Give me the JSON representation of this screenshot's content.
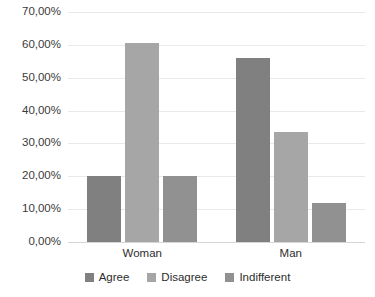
{
  "chart_data": {
    "type": "bar",
    "title": "",
    "subtitle": "",
    "xlabel": "",
    "ylabel": "",
    "categories": [
      "Woman",
      "Man"
    ],
    "series": [
      {
        "name": "Agree",
        "color": "#808080",
        "values": [
          20.0,
          56.0
        ]
      },
      {
        "name": "Disagree",
        "color": "#a6a6a6",
        "values": [
          60.5,
          33.5
        ]
      },
      {
        "name": "Indifferent",
        "color": "#919191",
        "values": [
          20.0,
          12.0
        ]
      }
    ],
    "ylim": [
      0,
      70
    ],
    "ytick_values": [
      0,
      10,
      20,
      30,
      40,
      50,
      60,
      70
    ],
    "ytick_labels": [
      "0,00%",
      "10,00%",
      "20,00%",
      "30,00%",
      "40,00%",
      "50,00%",
      "60,00%",
      "70,00%"
    ],
    "value_format": "percent-comma",
    "grid": {
      "horizontal": true,
      "vertical": false
    },
    "legend": {
      "position": "bottom",
      "orientation": "horizontal"
    },
    "axis_line_color": "#d6d6d6",
    "gridline_color": "#e9e9e9",
    "background_color": "#ffffff"
  }
}
